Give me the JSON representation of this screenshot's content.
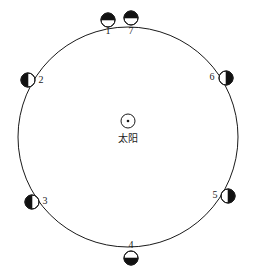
{
  "figure": {
    "type": "moon-phase-orbit-diagram",
    "background_color": "#ffffff",
    "stroke_color": "#1a1a1a",
    "fill_dark": "#111111",
    "fill_light": "#ffffff"
  },
  "orbit": {
    "name": "lunar-orbit-circle",
    "center_x": 128,
    "center_y": 137,
    "radius": 110,
    "stroke_width": 1
  },
  "sun": {
    "label": "太阳",
    "symbol": "sun-circle-with-dot",
    "center_x": 128,
    "center_y": 121,
    "radius": 7,
    "dot_radius": 1.3,
    "label_x": 128,
    "label_y": 133
  },
  "moons": [
    {
      "label": "1",
      "name": "moon-position-1",
      "cx": 108,
      "cy": 20,
      "r": 7,
      "phase": "dark-top-light-bottom",
      "dark_side": "top",
      "label_x": 108,
      "label_y": 31
    },
    {
      "label": "7",
      "name": "moon-position-7",
      "cx": 131,
      "cy": 18,
      "r": 7,
      "phase": "dark-top-crescent",
      "dark_side": "top",
      "label_x": 131,
      "label_y": 31
    },
    {
      "label": "2",
      "name": "moon-position-2",
      "cx": 28,
      "cy": 80,
      "r": 7,
      "phase": "dark-left-light-right",
      "dark_side": "left",
      "label_x": 41,
      "label_y": 80
    },
    {
      "label": "3",
      "name": "moon-position-3",
      "cx": 32,
      "cy": 202,
      "r": 7,
      "phase": "dark-left-light-right",
      "dark_side": "left",
      "label_x": 45,
      "label_y": 201
    },
    {
      "label": "4",
      "name": "moon-position-4",
      "cx": 131,
      "cy": 258,
      "r": 7,
      "phase": "dark-bottom-light-top",
      "dark_side": "bottom",
      "label_x": 131,
      "label_y": 245
    },
    {
      "label": "5",
      "name": "moon-position-5",
      "cx": 228,
      "cy": 196,
      "r": 7,
      "phase": "dark-right-light-left",
      "dark_side": "right",
      "label_x": 215,
      "label_y": 195
    },
    {
      "label": "6",
      "name": "moon-position-6",
      "cx": 226,
      "cy": 78,
      "r": 7,
      "phase": "dark-right-light-left",
      "dark_side": "right",
      "label_x": 212,
      "label_y": 77
    }
  ]
}
